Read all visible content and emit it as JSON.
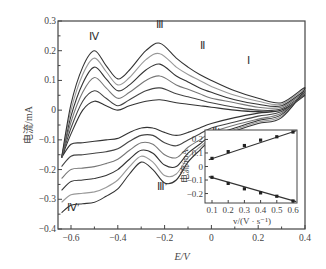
{
  "chart_data": [
    {
      "type": "line",
      "title": "",
      "xlabel": "E/V",
      "ylabel": "电流/mA",
      "xlim": [
        -0.65,
        0.4
      ],
      "ylim": [
        -0.4,
        0.3
      ],
      "xticks": [
        "-0.6",
        "-0.4",
        "-0.2",
        "0",
        "0.2",
        "0.4"
      ],
      "yticks": [
        "0.3",
        "0.2",
        "0.1",
        "0",
        "-0.1",
        "-0.2",
        "-0.3",
        "-0.4"
      ],
      "grid": false,
      "annotations": [
        {
          "text": "Ⅳ",
          "x": -0.5,
          "y": 0.235
        },
        {
          "text": "Ⅲ",
          "x": -0.22,
          "y": 0.275
        },
        {
          "text": "Ⅱ",
          "x": -0.04,
          "y": 0.205
        },
        {
          "text": "Ⅰ",
          "x": 0.16,
          "y": 0.155
        },
        {
          "text": "Ⅱ′",
          "x": 0.02,
          "y": -0.085
        },
        {
          "text": "Ⅲ′",
          "x": -0.21,
          "y": -0.27
        },
        {
          "text": "Ⅳ′",
          "x": -0.59,
          "y": -0.34
        }
      ],
      "series": [
        {
          "name": "scan 1 (0.1 V/s)",
          "color": "#333333",
          "forward": [
            [
              -0.64,
              -0.16
            ],
            [
              -0.6,
              -0.08
            ],
            [
              -0.55,
              0.0
            ],
            [
              -0.5,
              0.03
            ],
            [
              -0.45,
              0.015
            ],
            [
              -0.4,
              0.0
            ],
            [
              -0.35,
              0.015
            ],
            [
              -0.28,
              0.03
            ],
            [
              -0.22,
              0.035
            ],
            [
              -0.15,
              0.025
            ],
            [
              -0.1,
              0.02
            ],
            [
              -0.05,
              0.015
            ],
            [
              0.0,
              0.01
            ],
            [
              0.1,
              0.0
            ],
            [
              0.2,
              -0.005
            ],
            [
              0.3,
              0.0
            ],
            [
              0.4,
              0.05
            ]
          ],
          "reverse": [
            [
              0.4,
              0.035
            ],
            [
              0.3,
              0.0
            ],
            [
              0.2,
              -0.01
            ],
            [
              0.1,
              -0.025
            ],
            [
              0.0,
              -0.045
            ],
            [
              -0.05,
              -0.06
            ],
            [
              -0.1,
              -0.075
            ],
            [
              -0.15,
              -0.085
            ],
            [
              -0.2,
              -0.075
            ],
            [
              -0.25,
              -0.06
            ],
            [
              -0.3,
              -0.06
            ],
            [
              -0.35,
              -0.075
            ],
            [
              -0.4,
              -0.095
            ],
            [
              -0.45,
              -0.1
            ],
            [
              -0.5,
              -0.105
            ],
            [
              -0.55,
              -0.11
            ],
            [
              -0.6,
              -0.115
            ],
            [
              -0.64,
              -0.16
            ]
          ]
        },
        {
          "name": "scan 2 (0.2 V/s)",
          "color": "#444444",
          "forward": [
            [
              -0.64,
              -0.16
            ],
            [
              -0.6,
              -0.06
            ],
            [
              -0.55,
              0.03
            ],
            [
              -0.5,
              0.065
            ],
            [
              -0.45,
              0.04
            ],
            [
              -0.4,
              0.015
            ],
            [
              -0.35,
              0.035
            ],
            [
              -0.28,
              0.065
            ],
            [
              -0.22,
              0.075
            ],
            [
              -0.15,
              0.055
            ],
            [
              -0.1,
              0.045
            ],
            [
              -0.05,
              0.035
            ],
            [
              0.0,
              0.025
            ],
            [
              0.1,
              0.01
            ],
            [
              0.2,
              0.0
            ],
            [
              0.3,
              0.005
            ],
            [
              0.4,
              0.055
            ]
          ],
          "reverse": [
            [
              0.4,
              0.03
            ],
            [
              0.3,
              -0.005
            ],
            [
              0.2,
              -0.02
            ],
            [
              0.1,
              -0.04
            ],
            [
              0.0,
              -0.06
            ],
            [
              -0.05,
              -0.08
            ],
            [
              -0.1,
              -0.1
            ],
            [
              -0.15,
              -0.12
            ],
            [
              -0.2,
              -0.11
            ],
            [
              -0.25,
              -0.085
            ],
            [
              -0.3,
              -0.085
            ],
            [
              -0.35,
              -0.105
            ],
            [
              -0.4,
              -0.13
            ],
            [
              -0.45,
              -0.14
            ],
            [
              -0.5,
              -0.145
            ],
            [
              -0.55,
              -0.15
            ],
            [
              -0.6,
              -0.155
            ],
            [
              -0.64,
              -0.19
            ]
          ]
        },
        {
          "name": "scan 3 (0.3 V/s)",
          "color": "#777777",
          "forward": [
            [
              -0.64,
              -0.16
            ],
            [
              -0.6,
              -0.04
            ],
            [
              -0.55,
              0.06
            ],
            [
              -0.5,
              0.11
            ],
            [
              -0.45,
              0.075
            ],
            [
              -0.4,
              0.04
            ],
            [
              -0.35,
              0.06
            ],
            [
              -0.28,
              0.1
            ],
            [
              -0.22,
              0.115
            ],
            [
              -0.15,
              0.085
            ],
            [
              -0.1,
              0.07
            ],
            [
              -0.05,
              0.055
            ],
            [
              0.0,
              0.04
            ],
            [
              0.1,
              0.025
            ],
            [
              0.2,
              0.01
            ],
            [
              0.3,
              0.01
            ],
            [
              0.4,
              0.06
            ]
          ],
          "reverse": [
            [
              0.4,
              0.025
            ],
            [
              0.3,
              -0.01
            ],
            [
              0.2,
              -0.03
            ],
            [
              0.1,
              -0.05
            ],
            [
              0.0,
              -0.075
            ],
            [
              -0.05,
              -0.1
            ],
            [
              -0.1,
              -0.125
            ],
            [
              -0.15,
              -0.16
            ],
            [
              -0.2,
              -0.15
            ],
            [
              -0.25,
              -0.115
            ],
            [
              -0.3,
              -0.11
            ],
            [
              -0.35,
              -0.135
            ],
            [
              -0.4,
              -0.165
            ],
            [
              -0.45,
              -0.18
            ],
            [
              -0.5,
              -0.19
            ],
            [
              -0.55,
              -0.195
            ],
            [
              -0.6,
              -0.2
            ],
            [
              -0.64,
              -0.23
            ]
          ]
        },
        {
          "name": "scan 4 (0.4 V/s)",
          "color": "#333333",
          "forward": [
            [
              -0.64,
              -0.16
            ],
            [
              -0.6,
              -0.02
            ],
            [
              -0.55,
              0.09
            ],
            [
              -0.5,
              0.145
            ],
            [
              -0.45,
              0.105
            ],
            [
              -0.4,
              0.065
            ],
            [
              -0.35,
              0.085
            ],
            [
              -0.28,
              0.135
            ],
            [
              -0.22,
              0.155
            ],
            [
              -0.15,
              0.115
            ],
            [
              -0.1,
              0.095
            ],
            [
              -0.05,
              0.075
            ],
            [
              0.0,
              0.06
            ],
            [
              0.1,
              0.035
            ],
            [
              0.2,
              0.02
            ],
            [
              0.3,
              0.015
            ],
            [
              0.4,
              0.065
            ]
          ],
          "reverse": [
            [
              0.4,
              0.02
            ],
            [
              0.3,
              -0.015
            ],
            [
              0.2,
              -0.035
            ],
            [
              0.1,
              -0.06
            ],
            [
              0.0,
              -0.085
            ],
            [
              -0.05,
              -0.115
            ],
            [
              -0.1,
              -0.145
            ],
            [
              -0.15,
              -0.19
            ],
            [
              -0.2,
              -0.185
            ],
            [
              -0.25,
              -0.145
            ],
            [
              -0.3,
              -0.135
            ],
            [
              -0.35,
              -0.165
            ],
            [
              -0.4,
              -0.2
            ],
            [
              -0.45,
              -0.22
            ],
            [
              -0.5,
              -0.23
            ],
            [
              -0.55,
              -0.235
            ],
            [
              -0.6,
              -0.24
            ],
            [
              -0.64,
              -0.27
            ]
          ]
        },
        {
          "name": "scan 5 (0.5 V/s)",
          "color": "#999999",
          "forward": [
            [
              -0.64,
              -0.16
            ],
            [
              -0.6,
              0.0
            ],
            [
              -0.55,
              0.12
            ],
            [
              -0.5,
              0.175
            ],
            [
              -0.45,
              0.13
            ],
            [
              -0.4,
              0.085
            ],
            [
              -0.35,
              0.11
            ],
            [
              -0.28,
              0.17
            ],
            [
              -0.22,
              0.19
            ],
            [
              -0.15,
              0.145
            ],
            [
              -0.1,
              0.12
            ],
            [
              -0.05,
              0.1
            ],
            [
              0.0,
              0.08
            ],
            [
              0.1,
              0.05
            ],
            [
              0.2,
              0.03
            ],
            [
              0.3,
              0.02
            ],
            [
              0.4,
              0.07
            ]
          ],
          "reverse": [
            [
              0.4,
              0.015
            ],
            [
              0.3,
              -0.02
            ],
            [
              0.2,
              -0.04
            ],
            [
              0.1,
              -0.065
            ],
            [
              0.0,
              -0.095
            ],
            [
              -0.05,
              -0.125
            ],
            [
              -0.1,
              -0.16
            ],
            [
              -0.15,
              -0.215
            ],
            [
              -0.2,
              -0.22
            ],
            [
              -0.25,
              -0.175
            ],
            [
              -0.3,
              -0.155
            ],
            [
              -0.35,
              -0.19
            ],
            [
              -0.4,
              -0.235
            ],
            [
              -0.45,
              -0.26
            ],
            [
              -0.5,
              -0.275
            ],
            [
              -0.55,
              -0.28
            ],
            [
              -0.6,
              -0.285
            ],
            [
              -0.64,
              -0.31
            ]
          ]
        },
        {
          "name": "scan 6 (0.6 V/s)",
          "color": "#333333",
          "forward": [
            [
              -0.64,
              -0.16
            ],
            [
              -0.6,
              0.02
            ],
            [
              -0.55,
              0.145
            ],
            [
              -0.5,
              0.2
            ],
            [
              -0.45,
              0.15
            ],
            [
              -0.4,
              0.105
            ],
            [
              -0.35,
              0.135
            ],
            [
              -0.28,
              0.2
            ],
            [
              -0.22,
              0.225
            ],
            [
              -0.15,
              0.175
            ],
            [
              -0.1,
              0.145
            ],
            [
              -0.05,
              0.12
            ],
            [
              0.0,
              0.1
            ],
            [
              0.1,
              0.065
            ],
            [
              0.2,
              0.04
            ],
            [
              0.3,
              0.025
            ],
            [
              0.4,
              0.075
            ]
          ],
          "reverse": [
            [
              0.4,
              0.01
            ],
            [
              0.3,
              -0.025
            ],
            [
              0.2,
              -0.045
            ],
            [
              0.1,
              -0.07
            ],
            [
              0.0,
              -0.1
            ],
            [
              -0.05,
              -0.135
            ],
            [
              -0.1,
              -0.175
            ],
            [
              -0.15,
              -0.235
            ],
            [
              -0.2,
              -0.245
            ],
            [
              -0.25,
              -0.2
            ],
            [
              -0.3,
              -0.175
            ],
            [
              -0.35,
              -0.215
            ],
            [
              -0.4,
              -0.265
            ],
            [
              -0.45,
              -0.29
            ],
            [
              -0.5,
              -0.31
            ],
            [
              -0.55,
              -0.315
            ],
            [
              -0.6,
              -0.32
            ],
            [
              -0.64,
              -0.345
            ]
          ]
        }
      ]
    },
    {
      "type": "scatter",
      "title": "inset",
      "xlabel": "v/(V·s⁻¹)",
      "ylabel": "电流/mA",
      "xlim": [
        0.07,
        0.63
      ],
      "ylim": [
        -0.27,
        0.27
      ],
      "xticks": [
        "0.1",
        "0.2",
        "0.3",
        "0.4",
        "0.5",
        "0.6"
      ],
      "yticks": [
        "0.2",
        "0.1",
        "0",
        "-0.1",
        "-0.2"
      ],
      "grid": false,
      "series": [
        {
          "name": "anodic",
          "x": [
            0.1,
            0.2,
            0.3,
            0.4,
            0.5,
            0.6
          ],
          "values": [
            0.06,
            0.11,
            0.155,
            0.195,
            0.22,
            0.255
          ],
          "fit": [
            [
              0.08,
              0.05
            ],
            [
              0.62,
              0.265
            ]
          ]
        },
        {
          "name": "cathodic",
          "x": [
            0.1,
            0.2,
            0.3,
            0.4,
            0.5,
            0.6
          ],
          "values": [
            -0.08,
            -0.125,
            -0.165,
            -0.195,
            -0.22,
            -0.255
          ],
          "fit": [
            [
              0.08,
              -0.075
            ],
            [
              0.62,
              -0.26
            ]
          ]
        }
      ]
    }
  ],
  "labels": {
    "xlabel": "E/V",
    "ylabel": "电流/mA",
    "inset_xlabel": "v/(V · s⁻¹)",
    "inset_ylabel": "电流/mA"
  }
}
